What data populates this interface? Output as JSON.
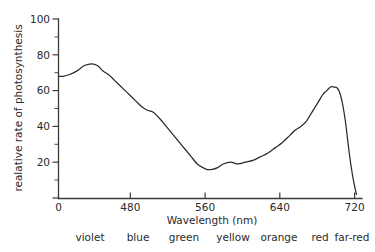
{
  "chart_data": {
    "type": "line",
    "title": "",
    "xlabel": "Wavelength (nm)",
    "ylabel": "realative rate of photosynthesis",
    "xlim": [
      400,
      725
    ],
    "ylim": [
      0,
      100
    ],
    "grid": false,
    "legend": "none",
    "x_ticks": [
      {
        "value": 400,
        "label": "0"
      },
      {
        "value": 480,
        "label": "480"
      },
      {
        "value": 560,
        "label": "560"
      },
      {
        "value": 640,
        "label": "640"
      },
      {
        "value": 720,
        "label": "720"
      }
    ],
    "y_ticks": [
      {
        "value": 0,
        "label": "0"
      },
      {
        "value": 20,
        "label": "20"
      },
      {
        "value": 40,
        "label": "40"
      },
      {
        "value": 60,
        "label": "60"
      },
      {
        "value": 80,
        "label": "80"
      },
      {
        "value": 100,
        "label": "100"
      }
    ],
    "y_minor_ticks": [
      10,
      30,
      50,
      70,
      90
    ],
    "series": [
      {
        "name": "relative rate of photosynthesis",
        "x": [
          400,
          405,
          412,
          420,
          428,
          436,
          442,
          448,
          454,
          460,
          466,
          472,
          478,
          484,
          490,
          496,
          502,
          510,
          518,
          526,
          534,
          542,
          550,
          556,
          560,
          566,
          572,
          578,
          586,
          594,
          602,
          610,
          618,
          626,
          634,
          642,
          650,
          656,
          662,
          668,
          674,
          680,
          686,
          690,
          694,
          698,
          702,
          706,
          710,
          714,
          718,
          722
        ],
        "y": [
          68,
          68,
          69,
          71,
          74,
          75,
          74,
          71,
          69,
          66,
          63,
          60,
          57,
          54,
          51,
          49,
          48,
          44,
          39,
          34,
          29,
          24,
          19,
          17,
          16,
          16,
          17,
          19,
          20,
          19,
          20,
          21,
          23,
          25,
          28,
          31,
          35,
          38,
          40,
          43,
          48,
          53,
          58,
          60,
          62,
          62,
          61,
          55,
          43,
          26,
          12,
          2
        ]
      }
    ],
    "color_bands": [
      {
        "label": "violet",
        "center_px": 90
      },
      {
        "label": "blue",
        "center_px": 138
      },
      {
        "label": "green",
        "center_px": 184
      },
      {
        "label": "yellow",
        "center_px": 233
      },
      {
        "label": "orange",
        "center_px": 279
      },
      {
        "label": "red",
        "center_px": 320
      },
      {
        "label": "far-red",
        "center_px": 352
      }
    ],
    "annotations": {
      "blue_peak_value": 75,
      "green_trough_value": 16,
      "red_peak_value": 62,
      "start_value": 68
    },
    "colors": {
      "curve": "#2b2b2b",
      "axis": "#3b3b3b",
      "background": "#ffffff",
      "text": "#2a2a2a"
    }
  }
}
